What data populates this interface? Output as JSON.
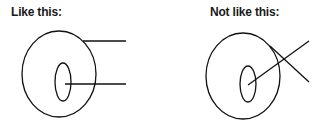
{
  "panels": [
    {
      "label": "Like this:"
    },
    {
      "label": "Not like this:"
    }
  ],
  "colors": {
    "stroke": "#111111",
    "background": "#ffffff"
  }
}
